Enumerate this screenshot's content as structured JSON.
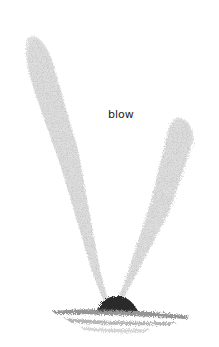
{
  "illustration": {
    "subject": "whale blow spray",
    "label": "blow",
    "colors": {
      "background": "#ffffff",
      "spray": "#b0b0b0",
      "whale_back": "#2a2a2a",
      "water": "#8a8a8a",
      "label_text": "#222222"
    }
  }
}
